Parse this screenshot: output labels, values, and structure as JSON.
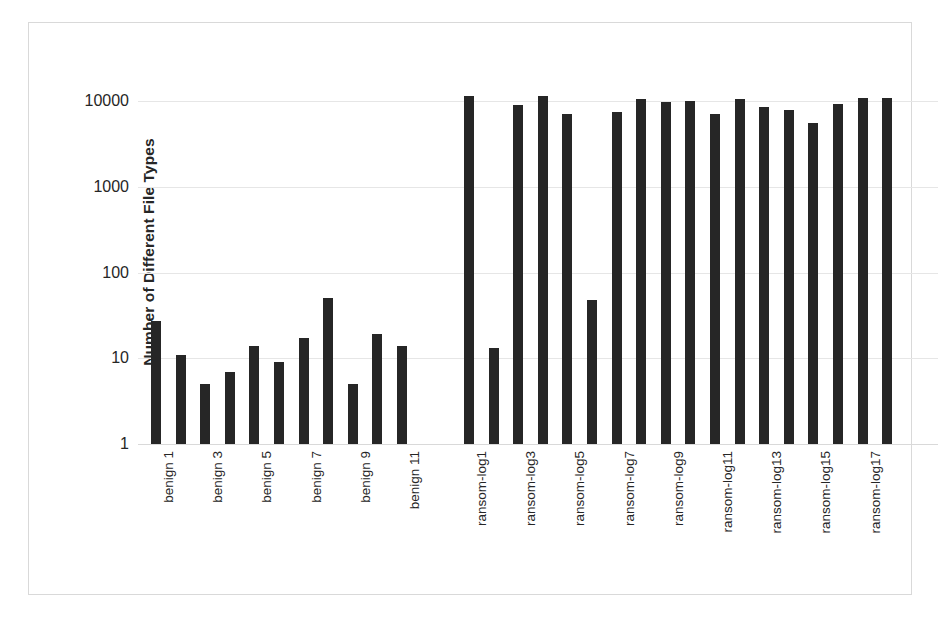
{
  "chart_data": {
    "type": "bar",
    "title": "",
    "xlabel": "",
    "ylabel": "Number of Different File Types",
    "yscale": "log",
    "ylim": [
      1,
      10000
    ],
    "ytick_labels": [
      "10000",
      "1000",
      "100",
      "10",
      "1"
    ],
    "ytick_values": [
      10000,
      1000,
      100,
      10,
      1
    ],
    "grid": true,
    "legend": "none",
    "bar_color": "#262626",
    "groups": [
      {
        "name": "benign",
        "categories": [
          "benign 1",
          "benign 2",
          "benign 3",
          "benign 4",
          "benign 5",
          "benign 6",
          "benign 7",
          "benign 8",
          "benign 9",
          "benign 10",
          "benign 11"
        ],
        "visible_tick_labels": [
          "benign 1",
          "",
          "benign 3",
          "",
          "benign 5",
          "",
          "benign 7",
          "",
          "benign 9",
          "",
          "benign 11"
        ],
        "values": [
          27,
          11,
          5,
          7,
          14,
          9,
          17,
          51,
          5,
          19,
          14
        ]
      },
      {
        "name": "ransom",
        "categories": [
          "ransom-log1",
          "ransom-log2",
          "ransom-log3",
          "ransom-log4",
          "ransom-log5",
          "ransom-log6",
          "ransom-log7",
          "ransom-log8",
          "ransom-log9",
          "ransom-log10",
          "ransom-log11",
          "ransom-log12",
          "ransom-log13",
          "ransom-log14",
          "ransom-log15",
          "ransom-log16",
          "ransom-log17",
          "ransom-log18"
        ],
        "visible_tick_labels": [
          "ransom-log1",
          "",
          "ransom-log3",
          "",
          "ransom-log5",
          "",
          "ransom-log7",
          "",
          "ransom-log9",
          "",
          "ransom-log11",
          "",
          "ransom-log13",
          "",
          "ransom-log15",
          "",
          "ransom-log17",
          ""
        ],
        "values": [
          11500,
          13,
          9000,
          11500,
          7000,
          48,
          7500,
          10500,
          9800,
          10000,
          7000,
          10500,
          8500,
          7800,
          5500,
          9300,
          10800,
          10700
        ]
      }
    ]
  }
}
